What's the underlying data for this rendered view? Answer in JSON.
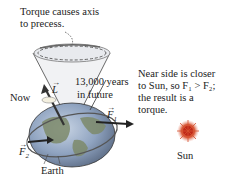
{
  "annotations": {
    "torque_line1": "Torque causes axis",
    "torque_line2": "to precess.",
    "now": "Now",
    "L_vector": "L",
    "future_line1": "13,000 years",
    "future_line2": "in future",
    "F1": "F",
    "F1_sub": "1",
    "F2": "F",
    "F2_sub": "2",
    "earth": "Earth",
    "near_line1": "Near side is closer",
    "near_line2": "to Sun, so F₁ > F₂;",
    "near_line3": "the result is a",
    "near_line4": "torque.",
    "sun": "Sun"
  },
  "colors": {
    "ocean": "#8fa9c9",
    "land": "#7d8a6a",
    "cone": "#9aa0a8",
    "sun": "#d04020",
    "text": "#222222"
  }
}
